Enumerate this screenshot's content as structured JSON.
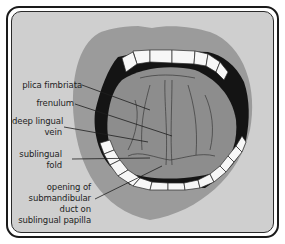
{
  "diagram": {
    "labels": [
      {
        "id": "plica-fimbriata",
        "lines": [
          "plica fimbriata"
        ]
      },
      {
        "id": "frenulum",
        "lines": [
          "frenulum"
        ]
      },
      {
        "id": "deep-lingual-vein",
        "lines": [
          "deep lingual",
          "vein"
        ]
      },
      {
        "id": "sublingual-fold",
        "lines": [
          "sublingual",
          "fold"
        ]
      },
      {
        "id": "submandibular-duct-opening",
        "lines": [
          "opening of",
          "submandibular",
          "duct on",
          "sublingual papilla"
        ]
      }
    ],
    "colors": {
      "background": "#cfcfcf",
      "lips": "#9a9a9a",
      "tongue": "#8c8c8c",
      "mouth_dark": "#141414",
      "teeth": "#f7f7f7",
      "frame": "#1a1a1a"
    }
  }
}
